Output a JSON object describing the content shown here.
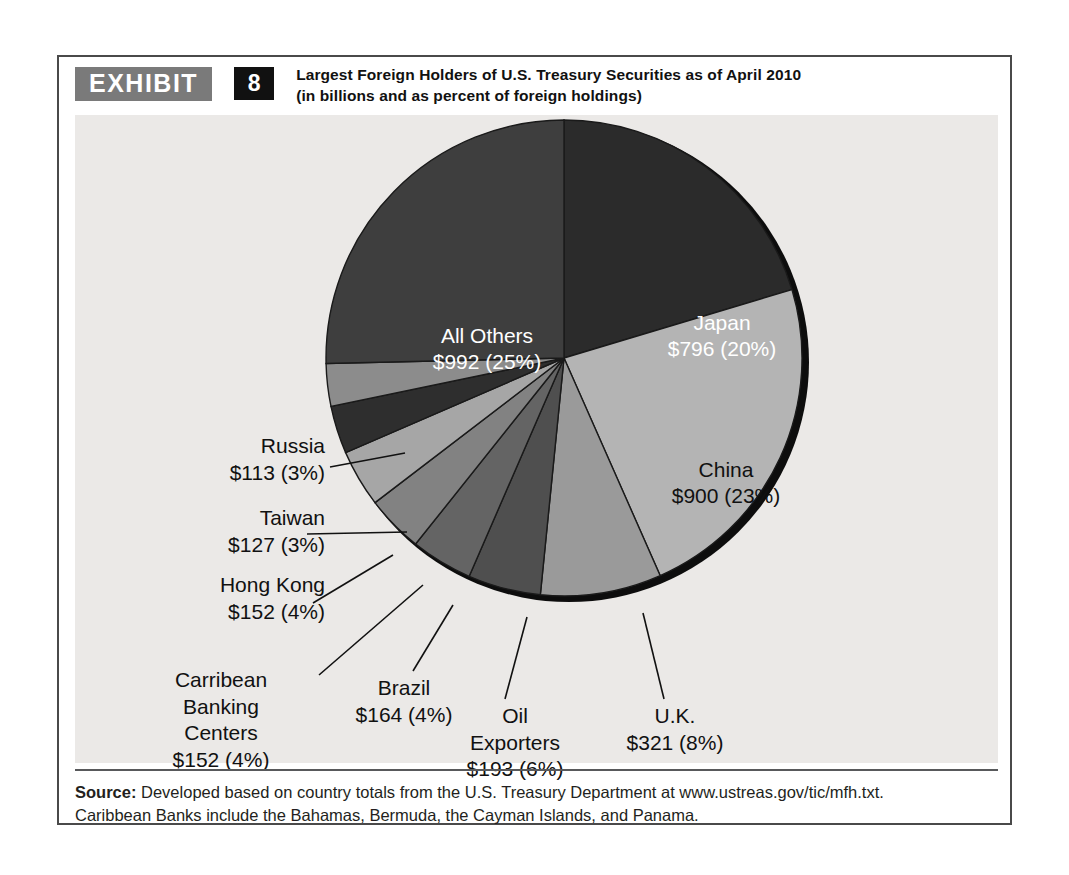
{
  "exhibit": {
    "badge_label": "EXHIBIT",
    "number": "8",
    "title_line1": "Largest Foreign Holders of U.S. Treasury Securities as of April 2010",
    "title_line2": "(in billions and as percent of foreign holdings)"
  },
  "source": {
    "label": "Source:",
    "line1_rest": " Developed based on country totals from the U.S. Treasury Department at www.ustreas.gov/tic/mfh.txt.",
    "line2": "Caribbean Banks include the Bahamas, Bermuda, the Cayman Islands, and Panama."
  },
  "colors": {
    "panel_background": "#ebe9e7",
    "frame_border": "#4a4a4a",
    "badge_gray": "#7a7a7a",
    "badge_black": "#111111",
    "slice_outline": "#1a1a1a",
    "pie_shadow": "#0d0d0d"
  },
  "chart_data": {
    "type": "pie",
    "title": "Largest Foreign Holders of U.S. Treasury Securities as of April 2010",
    "subtitle": "(in billions and as percent of foreign holdings)",
    "units": "billions of U.S. dollars",
    "value_total": 3910,
    "legend": "none",
    "start_angle_deg": 0,
    "direction": "clockwise",
    "categories": [
      "Japan",
      "China",
      "U.K.",
      "Oil Exporters",
      "Brazil",
      "Carribean Banking Centers",
      "Hong Kong",
      "Taiwan",
      "Russia",
      "All Others"
    ],
    "values": [
      796,
      900,
      321,
      193,
      164,
      152,
      152,
      127,
      113,
      992
    ],
    "percents": [
      20,
      23,
      8,
      6,
      4,
      4,
      4,
      3,
      3,
      25
    ],
    "slices": [
      {
        "name": "Japan",
        "value_label": "$796 (20%)",
        "value": 796,
        "percent": 20,
        "color": "#2b2b2b",
        "label_placement": "inside",
        "label_color": "#ffffff"
      },
      {
        "name": "China",
        "value_label": "$900 (23%)",
        "value": 900,
        "percent": 23,
        "color": "#b4b4b4",
        "label_placement": "inside",
        "label_color": "#111111"
      },
      {
        "name": "U.K.",
        "value_label": "$321 (8%)",
        "value": 321,
        "percent": 8,
        "color": "#9a9a9a",
        "label_placement": "callout",
        "label_color": "#111111"
      },
      {
        "name": "Oil",
        "name2": "Exporters",
        "value_label": "$193 (6%)",
        "value": 193,
        "percent": 6,
        "color": "#4f4f4f",
        "label_placement": "callout",
        "label_color": "#111111"
      },
      {
        "name": "Brazil",
        "value_label": "$164 (4%)",
        "value": 164,
        "percent": 4,
        "color": "#646464",
        "label_placement": "callout",
        "label_color": "#111111"
      },
      {
        "name": "Carribean",
        "name2": "Banking",
        "name3": "Centers",
        "value_label": "$152 (4%)",
        "value": 152,
        "percent": 4,
        "color": "#828282",
        "label_placement": "callout",
        "label_color": "#111111"
      },
      {
        "name": "Hong Kong",
        "value_label": "$152 (4%)",
        "value": 152,
        "percent": 4,
        "color": "#a6a6a6",
        "label_placement": "callout",
        "label_color": "#111111"
      },
      {
        "name": "Taiwan",
        "value_label": "$127 (3%)",
        "value": 127,
        "percent": 3,
        "color": "#2e2e2e",
        "label_placement": "callout",
        "label_color": "#111111"
      },
      {
        "name": "Russia",
        "value_label": "$113 (3%)",
        "value": 113,
        "percent": 3,
        "color": "#8c8c8c",
        "label_placement": "callout",
        "label_color": "#111111"
      },
      {
        "name": "All Others",
        "value_label": "$992 (25%)",
        "value": 992,
        "percent": 25,
        "color": "#3e3e3e",
        "label_placement": "inside",
        "label_color": "#ffffff"
      }
    ]
  }
}
